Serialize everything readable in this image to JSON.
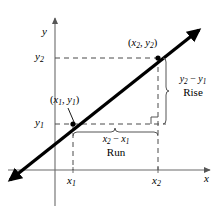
{
  "figure": {
    "type": "slope-diagram",
    "background_color": "#ffffff",
    "ink_color": "#000000",
    "axes": {
      "x_axis_label": "x",
      "y_axis_label": "y",
      "origin_px": [
        55,
        170
      ],
      "x_axis_end_px": [
        212,
        170
      ],
      "y_axis_end_px": [
        55,
        16
      ]
    },
    "line": {
      "description": "straight line with arrowheads at both ends passing through the two labeled points",
      "start_px": [
        8,
        182
      ],
      "end_px": [
        201,
        28
      ],
      "stroke_width": 3.2,
      "color": "#000000"
    },
    "points": [
      {
        "id": "p1",
        "label": "(x₁, y₁)",
        "x_symbol": "x",
        "x_sub": "1",
        "y_symbol": "y",
        "y_sub": "1",
        "px": [
          73,
          124
        ],
        "label_px": [
          52,
          98
        ],
        "has_leader_line": true,
        "dot": true
      },
      {
        "id": "p2",
        "label": "(x₂, y₂)",
        "x_symbol": "x",
        "x_sub": "2",
        "y_symbol": "y",
        "y_sub": "2",
        "px": [
          158,
          58
        ],
        "label_px": [
          129,
          40
        ],
        "has_leader_line": false,
        "dot": true
      }
    ],
    "tick_labels": {
      "x1": {
        "text": "x",
        "sub": "1",
        "px": [
          68,
          176
        ]
      },
      "x2": {
        "text": "x",
        "sub": "2",
        "px": [
          153,
          176
        ]
      },
      "y1": {
        "text": "y",
        "sub": "1",
        "px": [
          36,
          118
        ]
      },
      "y2": {
        "text": "y",
        "sub": "2",
        "px": [
          36,
          52
        ]
      }
    },
    "guides": {
      "dash_pattern": "5 4",
      "color": "#4a4a4a",
      "stroke_width": 1,
      "horizontal": [
        {
          "name": "y2-guide",
          "from_px": [
            55,
            58
          ],
          "to_px": [
            158,
            58
          ]
        },
        {
          "name": "y1-guide",
          "from_px": [
            55,
            124
          ],
          "to_px": [
            165,
            124
          ]
        }
      ],
      "vertical": [
        {
          "name": "x1-guide",
          "from_px": [
            73,
            124
          ],
          "to_px": [
            73,
            170
          ]
        },
        {
          "name": "x2-guide",
          "from_px": [
            158,
            58
          ],
          "to_px": [
            158,
            170
          ]
        }
      ]
    },
    "right_angle_marker": {
      "name": "right-angle-marker",
      "corner_px": [
        158,
        124
      ],
      "size_px": 7
    },
    "rise": {
      "expression": "y₂ − y₁",
      "minuend_symbol": "y",
      "minuend_sub": "2",
      "subtrahend_symbol": "y",
      "subtrahend_sub": "1",
      "word": "Rise",
      "brace_orientation": "vertical",
      "brace_x_px": 166,
      "brace_top_px": 58,
      "brace_bottom_px": 124,
      "label_px": [
        172,
        82
      ]
    },
    "run": {
      "expression": "x₂ − x₁",
      "minuend_symbol": "x",
      "minuend_sub": "2",
      "subtrahend_symbol": "x",
      "subtrahend_sub": "1",
      "word": "Run",
      "brace_orientation": "horizontal",
      "brace_y_px": 131,
      "brace_left_px": 73,
      "brace_right_px": 158,
      "label_px": [
        95,
        136
      ]
    }
  }
}
